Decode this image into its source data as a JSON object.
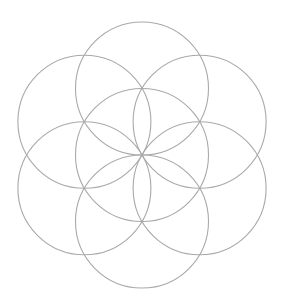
{
  "diagram": {
    "title": "Seed of Life",
    "shape": "seed-of-life",
    "stroke_color": "#a9a9a9",
    "stroke_width": 1.1,
    "background": "#ffffff",
    "center": {
      "x": 142,
      "y": 155
    },
    "radius": 66.5,
    "circles": [
      {
        "name": "center",
        "cx": 142,
        "cy": 155
      },
      {
        "name": "top",
        "cx": 142,
        "cy": 88.5
      },
      {
        "name": "top-right",
        "cx": 199.6,
        "cy": 121.75
      },
      {
        "name": "bottom-right",
        "cx": 199.6,
        "cy": 188.25
      },
      {
        "name": "bottom",
        "cx": 142,
        "cy": 221.5
      },
      {
        "name": "bottom-left",
        "cx": 84.4,
        "cy": 188.25
      },
      {
        "name": "top-left",
        "cx": 84.4,
        "cy": 121.75
      }
    ]
  }
}
